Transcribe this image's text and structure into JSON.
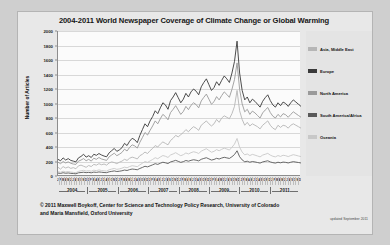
{
  "chart_data": {
    "type": "line",
    "title": "2004-2011 World Newspaper Coverage of Climate Change or Global Warming",
    "xlabel": "",
    "ylabel": "Number of Articles",
    "ylim": [
      0,
      2000
    ],
    "yticks": [
      0,
      200,
      400,
      600,
      800,
      1000,
      1200,
      1400,
      1600,
      1800,
      2000
    ],
    "grid": true,
    "legend_position": "right",
    "x_years": [
      "2004",
      "2005",
      "2006",
      "2007",
      "2008",
      "2009",
      "2010",
      "2011"
    ],
    "x_month_labels": [
      "J",
      "F",
      "M",
      "A",
      "M",
      "J",
      "J",
      "A",
      "S",
      "O",
      "N",
      "D"
    ],
    "x_tick_groups": [
      "J F M A M J J A S O N D",
      "J F M A M J J A S O N D",
      "J F M A M J J A S O N D",
      "J F M A M J J A S O N D",
      "J F M A M J J A S O N D",
      "J F M A M J J A S O N D",
      "J F M A M J J A S O N D",
      "J F M A M J J A S O N D"
    ],
    "series": [
      {
        "name": "Asia, Middle East",
        "color": "#b6b6b6",
        "values": [
          120,
          95,
          130,
          110,
          125,
          105,
          115,
          100,
          140,
          150,
          135,
          120,
          145,
          130,
          160,
          150,
          170,
          155,
          165,
          150,
          180,
          195,
          185,
          170,
          190,
          205,
          230,
          215,
          245,
          260,
          250,
          235,
          280,
          300,
          330,
          310,
          350,
          380,
          420,
          400,
          440,
          470,
          450,
          430,
          490,
          520,
          560,
          540,
          570,
          600,
          640,
          610,
          650,
          680,
          660,
          630,
          700,
          730,
          760,
          720,
          690,
          720,
          780,
          740,
          800,
          830,
          810,
          790,
          860,
          960,
          1180,
          900,
          780,
          700,
          740,
          690,
          720,
          700,
          680,
          650,
          700,
          730,
          760,
          700,
          660,
          640,
          700,
          670,
          700,
          690,
          660,
          700,
          720,
          700,
          680,
          660
        ]
      },
      {
        "name": "Europe",
        "color": "#3a3a3a",
        "values": [
          230,
          210,
          250,
          220,
          240,
          215,
          205,
          195,
          250,
          270,
          300,
          260,
          280,
          255,
          300,
          285,
          310,
          290,
          275,
          265,
          320,
          350,
          380,
          340,
          360,
          390,
          450,
          420,
          480,
          520,
          500,
          460,
          560,
          640,
          720,
          680,
          760,
          820,
          900,
          860,
          940,
          1010,
          980,
          920,
          1040,
          1090,
          1150,
          1080,
          1010,
          1060,
          1140,
          1090,
          1160,
          1200,
          1170,
          1120,
          1230,
          1290,
          1340,
          1260,
          1180,
          1220,
          1300,
          1250,
          1320,
          1380,
          1340,
          1290,
          1420,
          1580,
          1860,
          1420,
          1180,
          1050,
          1090,
          1010,
          1060,
          1030,
          990,
          950,
          1030,
          1080,
          1120,
          1040,
          980,
          950,
          1010,
          970,
          1020,
          1000,
          960,
          1010,
          1050,
          1020,
          990,
          960
        ]
      },
      {
        "name": "North America",
        "color": "#9a9a9a",
        "values": [
          190,
          170,
          200,
          180,
          195,
          175,
          165,
          160,
          205,
          220,
          240,
          210,
          230,
          205,
          245,
          230,
          255,
          235,
          225,
          215,
          265,
          290,
          315,
          280,
          300,
          325,
          370,
          345,
          395,
          430,
          415,
          385,
          465,
          530,
          600,
          565,
          630,
          690,
          760,
          720,
          790,
          850,
          820,
          775,
          875,
          920,
          970,
          910,
          850,
          890,
          960,
          915,
          975,
          1010,
          985,
          940,
          1035,
          1085,
          1130,
          1060,
          990,
          1025,
          1095,
          1050,
          1110,
          1160,
          1125,
          1085,
          1195,
          1330,
          1560,
          1195,
          995,
          885,
          920,
          850,
          895,
          870,
          835,
          800,
          870,
          910,
          945,
          875,
          825,
          800,
          850,
          815,
          860,
          845,
          810,
          850,
          885,
          860,
          835,
          810
        ]
      },
      {
        "name": "South America/Africa",
        "color": "#595959",
        "values": [
          40,
          35,
          45,
          38,
          42,
          36,
          34,
          30,
          44,
          48,
          52,
          46,
          50,
          44,
          54,
          50,
          56,
          52,
          48,
          46,
          58,
          64,
          70,
          62,
          66,
          72,
          82,
          76,
          88,
          96,
          92,
          86,
          104,
          118,
          134,
          126,
          140,
          154,
          170,
          160,
          176,
          190,
          182,
          172,
          194,
          204,
          216,
          202,
          188,
          198,
          214,
          204,
          216,
          224,
          218,
          208,
          230,
          242,
          252,
          236,
          220,
          228,
          244,
          234,
          248,
          258,
          250,
          242,
          266,
          296,
          348,
          266,
          222,
          196,
          204,
          190,
          200,
          194,
          186,
          178,
          194,
          202,
          210,
          194,
          184,
          178,
          190,
          182,
          192,
          188,
          180,
          190,
          198,
          192,
          186,
          180
        ]
      },
      {
        "name": "Oceania",
        "color": "#c8c8c8",
        "values": [
          60,
          52,
          66,
          56,
          62,
          54,
          50,
          46,
          64,
          72,
          78,
          68,
          74,
          66,
          80,
          74,
          84,
          76,
          72,
          68,
          86,
          96,
          104,
          92,
          98,
          108,
          122,
          114,
          130,
          142,
          136,
          128,
          154,
          176,
          200,
          188,
          208,
          228,
          252,
          238,
          262,
          282,
          272,
          256,
          290,
          304,
          322,
          300,
          280,
          294,
          318,
          304,
          322,
          334,
          326,
          310,
          342,
          360,
          376,
          352,
          328,
          340,
          364,
          348,
          368,
          384,
          372,
          358,
          396,
          440,
          518,
          396,
          330,
          292,
          304,
          282,
          298,
          288,
          276,
          264,
          288,
          300,
          312,
          288,
          272,
          264,
          282,
          270,
          286,
          280,
          268,
          282,
          294,
          286,
          276,
          268
        ]
      }
    ]
  },
  "footer": {
    "credit_line_1": "© 2011 Maxwell Boykoff, Center for Science and Technology Policy Research, University of Colorado",
    "credit_line_2": "and Maria Mansfield, Oxford University",
    "updated": "updated September 2011"
  }
}
